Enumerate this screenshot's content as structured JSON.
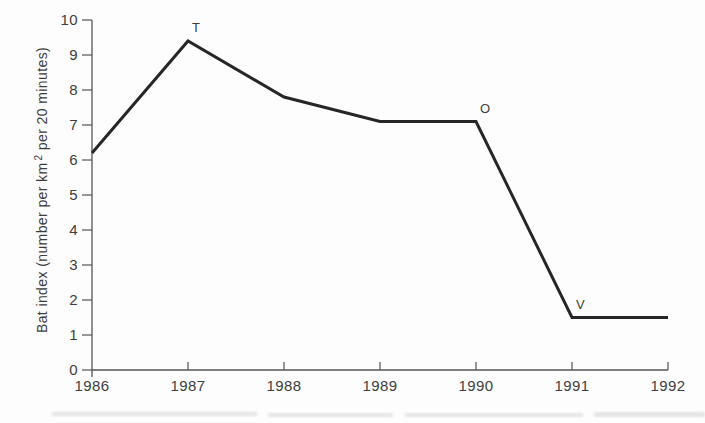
{
  "chart_data": {
    "type": "line",
    "title": "",
    "xlabel": "",
    "ylabel": "Bat index (number per km² per 20 minutes)",
    "ylabel_parts": {
      "before_sup": "Bat index (number per km",
      "sup": "2",
      "after_sup": " per 20 minutes)"
    },
    "x": [
      1986,
      1987,
      1988,
      1989,
      1990,
      1991,
      1992
    ],
    "series": [
      {
        "name": "Bat index",
        "values": [
          6.2,
          9.4,
          7.8,
          7.1,
          7.1,
          1.5,
          1.5
        ]
      }
    ],
    "point_labels": [
      {
        "text": "T",
        "x": 1987,
        "value": 9.4
      },
      {
        "text": "O",
        "x": 1990,
        "value": 7.1
      },
      {
        "text": "V",
        "x": 1991,
        "value": 1.5
      }
    ],
    "xlim": [
      1986,
      1992
    ],
    "ylim": [
      0,
      10
    ],
    "x_ticks": [
      1986,
      1987,
      1988,
      1989,
      1990,
      1991,
      1992
    ],
    "y_ticks": [
      0,
      1,
      2,
      3,
      4,
      5,
      6,
      7,
      8,
      9,
      10
    ],
    "grid": false,
    "legend": "none",
    "colors": {
      "line": "#262626",
      "axis": "#555555",
      "text": "#3d3d3d",
      "background": "#fdfdfd"
    }
  }
}
